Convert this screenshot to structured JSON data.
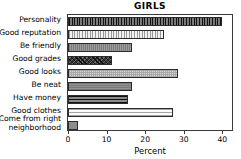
{
  "chart_data": {
    "type": "bar",
    "orientation": "horizontal",
    "title": "GIRLS",
    "xlabel": "Percent",
    "ylabel": "",
    "xlim": [
      0,
      42.5
    ],
    "grid": false,
    "legend": "none",
    "xticks": [
      0,
      10,
      20,
      30,
      40
    ],
    "xticklabels": [
      "0",
      "10",
      "20",
      "30",
      "40"
    ],
    "categories": [
      "Personality",
      "Good reputation",
      "Be friendly",
      "Good grades",
      "Good looks",
      "Be neat",
      "Have money",
      "Good clothes",
      "Come from right\nneighborhood"
    ],
    "values": [
      39.8,
      25.0,
      16.5,
      11.5,
      28.5,
      16.5,
      15.5,
      27.2,
      2.6
    ],
    "bar_patterns": [
      "vertical-stripes-dark",
      "vertical-stripes-light",
      "solid-gray",
      "crosshatch-dark",
      "checker-light",
      "gray-medium",
      "horizontal-stripes-dark",
      "horizontal-stripes-light",
      "plain-gray"
    ]
  }
}
